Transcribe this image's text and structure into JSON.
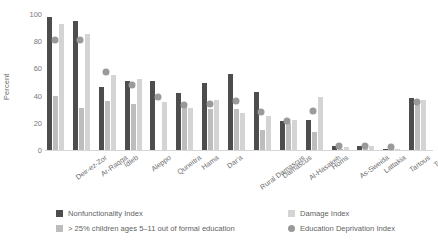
{
  "chart_data": {
    "type": "bar",
    "title": "",
    "xlabel": "",
    "ylabel": "Percent",
    "ylim": [
      0,
      100
    ],
    "yticks": [
      0,
      20,
      40,
      60,
      80,
      100
    ],
    "grid": false,
    "legend_position": "bottom",
    "categories": [
      "Deir-ez-Zor",
      "Ar-Raqqa",
      "Idleb",
      "Aleppo",
      "Quneitra",
      "Hama",
      "Dar'a",
      "Rural Damascus",
      "Damascus",
      "Al-Hasakeh",
      "Homs",
      "As-Sweida",
      "Lattakia",
      "Tartous",
      "Total"
    ],
    "series": [
      {
        "name": "Nonfunctionality Index",
        "kind": "bar",
        "color": "#4d4d4d",
        "values": [
          98,
          95,
          46,
          51,
          51,
          42,
          49,
          56,
          43,
          21,
          22,
          3,
          3,
          1,
          38
        ]
      },
      {
        "name": "> 25% children ages 5–11 out of formal education",
        "kind": "bar",
        "color": "#bdbdbd",
        "values": [
          40,
          31,
          36,
          34,
          0,
          32,
          30,
          30,
          15,
          20,
          13,
          1,
          1,
          1,
          33
        ]
      },
      {
        "name": "Damage Index",
        "kind": "bar",
        "color": "#d4d4d4",
        "values": [
          93,
          85,
          55,
          52,
          35,
          31,
          37,
          27,
          25,
          22,
          39,
          2,
          3,
          1,
          37
        ]
      },
      {
        "name": "Education Deprivation Index",
        "kind": "marker",
        "color": "#9a9a9a",
        "values": [
          81,
          81,
          57,
          48,
          39,
          33,
          34,
          36,
          28,
          21,
          29,
          3,
          3,
          2,
          35
        ]
      }
    ]
  }
}
